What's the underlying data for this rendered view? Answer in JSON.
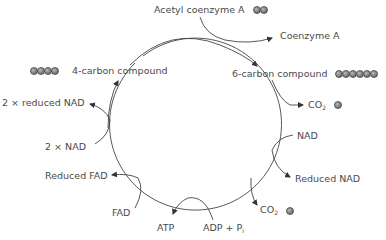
{
  "diagram": {
    "labels": {
      "acetyl_coa": "Acetyl coenzyme A",
      "coenzyme_a": "Coenzyme A",
      "six_carbon": "6-carbon compound",
      "four_carbon": "4-carbon compound",
      "co2_1_main": "CO",
      "co2_1_sub": "2",
      "nad": "NAD",
      "reduced_nad": "Reduced NAD",
      "co2_2_main": "CO",
      "co2_2_sub": "2",
      "adp_main": "ADP + P",
      "adp_sub": "i",
      "atp": "ATP",
      "fad": "FAD",
      "reduced_fad": "Reduced FAD",
      "two_nad": "2 × NAD",
      "two_reduced_nad": "2 × reduced NAD"
    },
    "molecules": {
      "acetyl_coa_carbons": 2,
      "six_carbon_carbons": 6,
      "four_carbon_carbons": 4,
      "co2_1_carbons": 1,
      "co2_2_carbons": 1
    }
  }
}
